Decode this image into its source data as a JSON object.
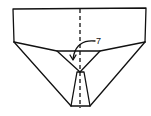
{
  "diagram": {
    "type": "origami-fold-step",
    "step_label": "7",
    "colors": {
      "stroke": "#111111",
      "background": "#ffffff"
    },
    "elements": [
      {
        "name": "top-flap-rectangle"
      },
      {
        "name": "center-crease-dashed-line"
      },
      {
        "name": "inverted-triangle-flap"
      },
      {
        "name": "bottom-v-body"
      },
      {
        "name": "center-narrow-strip"
      },
      {
        "name": "fold-arrow",
        "points_to": "inverted-triangle-flap"
      }
    ]
  }
}
